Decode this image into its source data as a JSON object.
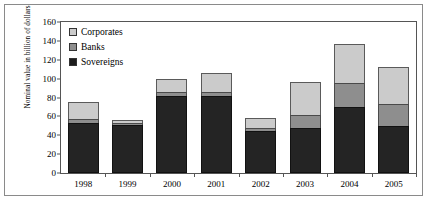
{
  "chart_data": {
    "type": "bar",
    "stacked": true,
    "title": "",
    "subtitle": "",
    "xlabel": "",
    "ylabel": "Nominal value in billion of dollars",
    "categories": [
      "1998",
      "1999",
      "2000",
      "2001",
      "2002",
      "2003",
      "2004",
      "2005"
    ],
    "series": [
      {
        "name": "Sovereigns",
        "color": "#242424",
        "values": [
          53,
          51,
          82,
          82,
          45,
          48,
          70,
          50
        ]
      },
      {
        "name": "Banks",
        "color": "#8e8e8e",
        "values": [
          4,
          2,
          4,
          4,
          3,
          14,
          25,
          23
        ]
      },
      {
        "name": "Corporates",
        "color": "#cbcbcb",
        "values": [
          18,
          3,
          14,
          20,
          10,
          34,
          42,
          39
        ]
      }
    ],
    "totals": [
      75,
      56,
      100,
      106,
      58,
      96,
      137,
      112
    ],
    "ylim": [
      0,
      160
    ],
    "ytick_step": 20,
    "yticks": [
      "160",
      "140",
      "120",
      "100",
      "80",
      "60",
      "40",
      "20",
      "0"
    ],
    "grid": false,
    "legend_position": "inside-top-left",
    "legend": [
      {
        "label": "Corporates",
        "swatch": "corporates"
      },
      {
        "label": "Banks",
        "swatch": "banks"
      },
      {
        "label": "Sovereigns",
        "swatch": "sovereigns"
      }
    ]
  }
}
